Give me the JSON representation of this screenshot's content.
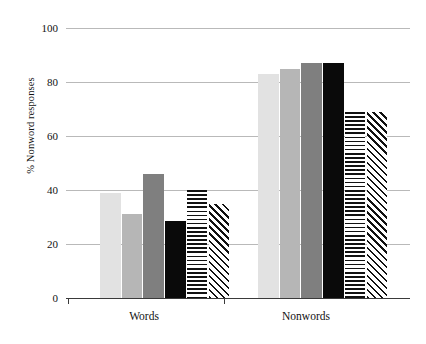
{
  "chart_data": {
    "type": "bar",
    "title": "",
    "subtitle": "",
    "xlabel": "",
    "ylabel": "% Nonword responses",
    "categories": [
      "Words",
      "Nonwords"
    ],
    "ylim": [
      0,
      100
    ],
    "ytick_values": [
      0,
      20,
      40,
      60,
      80,
      100
    ],
    "ytick_labels": [
      "0",
      "20",
      "40",
      "60",
      "80",
      "100"
    ],
    "grid": true,
    "grid_axis": "y",
    "legend": false,
    "legend_position": "none",
    "annotations": [],
    "series": [
      {
        "name": "series-1",
        "fill": "light-gray",
        "color": "#e2e2e2",
        "pattern": "solid",
        "values": [
          39,
          83
        ]
      },
      {
        "name": "series-2",
        "fill": "medium-gray",
        "color": "#b6b6b6",
        "pattern": "solid",
        "values": [
          31,
          85
        ]
      },
      {
        "name": "series-3",
        "fill": "dark-gray",
        "color": "#7f7f7f",
        "pattern": "solid",
        "values": [
          46,
          87
        ]
      },
      {
        "name": "series-4",
        "fill": "black",
        "color": "#0a0a0a",
        "pattern": "solid",
        "values": [
          28.5,
          87
        ]
      },
      {
        "name": "series-5",
        "fill": "horizontal-stripe",
        "color": "#111111",
        "pattern": "horizontal-stripes",
        "values": [
          40,
          69
        ]
      },
      {
        "name": "series-6",
        "fill": "diagonal-stripe",
        "color": "#111111",
        "pattern": "diagonal-stripes",
        "values": [
          35,
          69
        ]
      }
    ]
  },
  "axis": {
    "y_label_text": "% Nonword responses",
    "x_category_labels": [
      "Words",
      "Nonwords"
    ]
  },
  "colors": {
    "gridline": "#b9b9b9",
    "axis": "#3a3a3a",
    "text": "#111111",
    "background": "#ffffff"
  }
}
